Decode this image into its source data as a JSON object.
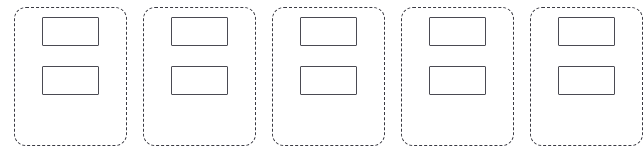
{
  "canvas": {
    "width": 633,
    "height": 160,
    "background_color": "#ffffff"
  },
  "style": {
    "card_border_color": "#3a3a42",
    "card_border_style": "dashed",
    "card_border_radius": "12px",
    "slot_border_color": "#4a4a52",
    "slot_border_style": "solid",
    "slot_fill_color": "#ffffff"
  },
  "layout": {
    "card_count": 5,
    "card_width": 113,
    "card_height": 139,
    "card_gap": 16,
    "slot_width": 57,
    "slot_height": 29,
    "slot_gap": 20
  },
  "cards": [
    {
      "id": "card-1",
      "slots": [
        {
          "id": "card-1-slot-1",
          "value": ""
        },
        {
          "id": "card-1-slot-2",
          "value": ""
        }
      ]
    },
    {
      "id": "card-2",
      "slots": [
        {
          "id": "card-2-slot-1",
          "value": ""
        },
        {
          "id": "card-2-slot-2",
          "value": ""
        }
      ]
    },
    {
      "id": "card-3",
      "slots": [
        {
          "id": "card-3-slot-1",
          "value": ""
        },
        {
          "id": "card-3-slot-2",
          "value": ""
        }
      ]
    },
    {
      "id": "card-4",
      "slots": [
        {
          "id": "card-4-slot-1",
          "value": ""
        },
        {
          "id": "card-4-slot-2",
          "value": ""
        }
      ]
    },
    {
      "id": "card-5",
      "slots": [
        {
          "id": "card-5-slot-1",
          "value": ""
        },
        {
          "id": "card-5-slot-2",
          "value": ""
        }
      ]
    }
  ]
}
